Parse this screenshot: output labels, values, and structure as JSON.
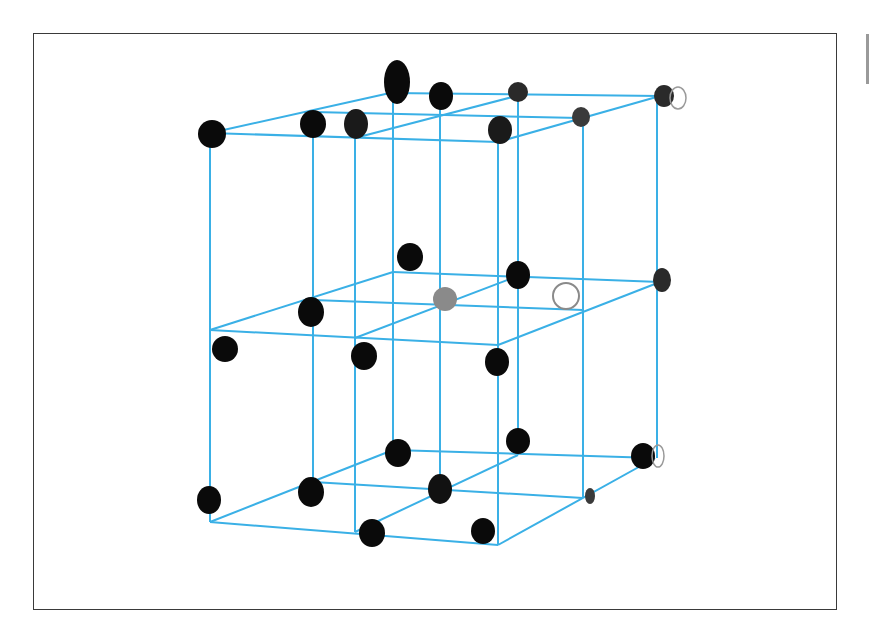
{
  "figure": {
    "kind": "crystal-lattice-diagram",
    "colors": {
      "frame": "#3a3a3a",
      "lattice_lines": "#3ab0e6",
      "atom_dark": "#0a0a0a",
      "atom_faded": "#9a9a9a",
      "background": "#ffffff"
    },
    "layers": [
      {
        "name": "top",
        "y_front": 130
      },
      {
        "name": "middle",
        "y_front": 330
      },
      {
        "name": "bottom",
        "y_front": 500
      }
    ]
  }
}
